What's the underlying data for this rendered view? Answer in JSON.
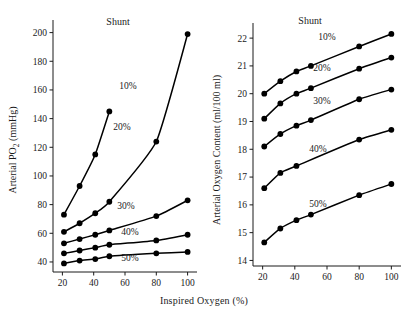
{
  "figure": {
    "shared_xlabel": "Inspired Oxygen (%)",
    "shunt_label": "Shunt"
  },
  "chart_data": [
    {
      "type": "line",
      "panel": "left",
      "title": "",
      "xlabel": "Inspired Oxygen (%)",
      "ylabel": "Arterial PO₂ (mmHg)",
      "ylabel_plain": "Arterial PO2 (mmHg)",
      "xlim": [
        14,
        106
      ],
      "ylim": [
        33,
        206
      ],
      "xticks": [
        20,
        40,
        60,
        80,
        100
      ],
      "yticks": [
        40,
        60,
        80,
        100,
        120,
        140,
        160,
        180,
        200
      ],
      "xticklabels": [
        "20",
        "40",
        "60",
        "80",
        "100"
      ],
      "yticklabels": [
        "40",
        "60",
        "80",
        "100",
        "120",
        "140",
        "160",
        "180",
        "200"
      ],
      "grid": false,
      "legend": "inline-annotations",
      "annotations": [
        "Shunt"
      ],
      "series": [
        {
          "name": "10%",
          "label": "10%",
          "x": [
            21,
            31,
            41,
            50
          ],
          "y": [
            73,
            93,
            115,
            145
          ]
        },
        {
          "name": "20%",
          "label": "20%",
          "x": [
            21,
            31,
            41,
            50,
            80,
            100
          ],
          "y": [
            61,
            67,
            74,
            82,
            124,
            199
          ]
        },
        {
          "name": "30%",
          "label": "30%",
          "x": [
            21,
            31,
            41,
            50,
            80,
            100
          ],
          "y": [
            53,
            56,
            59,
            62,
            72,
            83
          ]
        },
        {
          "name": "40%",
          "label": "40%",
          "x": [
            21,
            31,
            41,
            50,
            80,
            100
          ],
          "y": [
            46,
            48,
            50,
            52,
            55,
            59
          ]
        },
        {
          "name": "50%",
          "label": "50%",
          "x": [
            21,
            31,
            41,
            50,
            80,
            100
          ],
          "y": [
            39,
            41,
            42,
            44,
            46,
            47
          ]
        }
      ]
    },
    {
      "type": "line",
      "panel": "right",
      "title": "",
      "xlabel": "Inspired Oxygen (%)",
      "ylabel": "Arterial Oxygen Content (ml/100 ml)",
      "xlim": [
        14,
        106
      ],
      "ylim": [
        13.8,
        22.4
      ],
      "xticks": [
        20,
        40,
        60,
        80,
        100
      ],
      "yticks": [
        14,
        15,
        16,
        17,
        18,
        19,
        20,
        21,
        22
      ],
      "xticklabels": [
        "20",
        "40",
        "60",
        "80",
        "100"
      ],
      "yticklabels": [
        "14",
        "15",
        "16",
        "17",
        "18",
        "19",
        "20",
        "21",
        "22"
      ],
      "grid": false,
      "legend": "inline-annotations",
      "annotations": [
        "Shunt"
      ],
      "series": [
        {
          "name": "10%",
          "label": "10%",
          "x": [
            21,
            31,
            41,
            50,
            80,
            100
          ],
          "y": [
            20.0,
            20.45,
            20.8,
            21.0,
            21.7,
            22.15
          ]
        },
        {
          "name": "20%",
          "label": "20%",
          "x": [
            21,
            31,
            41,
            50,
            80,
            100
          ],
          "y": [
            19.1,
            19.65,
            20.0,
            20.2,
            20.9,
            21.3
          ]
        },
        {
          "name": "30%",
          "label": "30%",
          "x": [
            21,
            31,
            41,
            50,
            80,
            100
          ],
          "y": [
            18.1,
            18.55,
            18.85,
            19.05,
            19.8,
            20.15
          ]
        },
        {
          "name": "40%",
          "label": "40%",
          "x": [
            21,
            31,
            41,
            80,
            100
          ],
          "y": [
            16.6,
            17.15,
            17.4,
            18.35,
            18.7
          ]
        },
        {
          "name": "50%",
          "label": "50%",
          "x": [
            21,
            31,
            41,
            50,
            80,
            100
          ],
          "y": [
            14.65,
            15.15,
            15.45,
            15.65,
            16.35,
            16.75
          ]
        }
      ]
    }
  ],
  "left_panel": {
    "ylabel_parts": {
      "pre": "Arterial PO",
      "sub": "2",
      "post": " (mmHg)"
    },
    "series_label_positions": [
      {
        "label": "10%",
        "x": 128,
        "y": 89
      },
      {
        "label": "20%",
        "x": 122,
        "y": 130
      },
      {
        "label": "30%",
        "x": 126,
        "y": 209
      },
      {
        "label": "40%",
        "x": 130,
        "y": 235
      },
      {
        "label": "50%",
        "x": 130,
        "y": 261
      }
    ],
    "shunt_position": {
      "x": 118,
      "y": 25
    }
  },
  "right_panel": {
    "ylabel": "Arterial Oxygen Content (ml/100 ml)",
    "series_label_positions": [
      {
        "label": "10%",
        "x": 327,
        "y": 40
      },
      {
        "label": "20%",
        "x": 322,
        "y": 71
      },
      {
        "label": "30%",
        "x": 322,
        "y": 104
      },
      {
        "label": "40%",
        "x": 318,
        "y": 152
      },
      {
        "label": "50%",
        "x": 318,
        "y": 207
      }
    ],
    "shunt_position": {
      "x": 310,
      "y": 24
    }
  }
}
